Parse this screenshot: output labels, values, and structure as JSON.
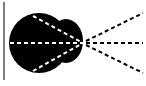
{
  "diagram": {
    "colors": {
      "background": "#ffffff",
      "blob": "#000000",
      "border": "#555555",
      "dash_inside": "#ffffff",
      "dash_outside": "#000000"
    },
    "focal_point": {
      "x": 83,
      "y": 43
    },
    "rays": [
      {
        "name": "upper",
        "from": [
          35,
          14
        ],
        "to": [
          143,
          13
        ]
      },
      {
        "name": "middle",
        "from": [
          10,
          43
        ],
        "to": [
          143,
          43
        ]
      },
      {
        "name": "lower",
        "from": [
          35,
          72
        ],
        "to": [
          143,
          73
        ]
      }
    ]
  }
}
